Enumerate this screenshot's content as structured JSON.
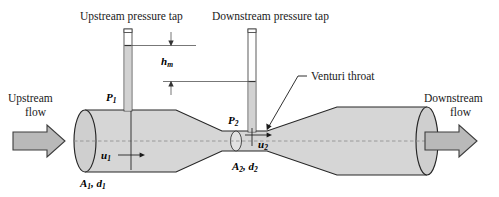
{
  "figure": {
    "background_color": "#ffffff"
  },
  "labels": {
    "upstream_tap": "Upstream pressure tap",
    "downstream_tap": "Downstream pressure tap",
    "venturi_throat": "Venturi throat",
    "upstream_flow_line1": "Upstream",
    "upstream_flow_line2": "flow",
    "downstream_flow_line1": "Downstream",
    "downstream_flow_line2": "flow"
  },
  "symbols": {
    "p1_base": "P",
    "p1_sub": "1",
    "p2_base": "P",
    "p2_sub": "2",
    "u1_base": "u",
    "u1_sub": "1",
    "u2_base": "u",
    "u2_sub": "2",
    "hm_base": "h",
    "hm_sub": "m",
    "area1_a": "A",
    "area1_a_sub": "1",
    "area1_sep": ", ",
    "area1_d": "d",
    "area1_d_sub": "1",
    "area2_a": "A",
    "area2_a_sub": "2",
    "area2_sep": ", ",
    "area2_d": "d",
    "area2_d_sub": "2"
  },
  "colors": {
    "pipe_fill": "#d6d6d6",
    "pipe_outline": "#262626",
    "endcap_fill": "#cfcfcf",
    "arrow_fill": "#b9b9b9",
    "arrow_outline": "#3d3d3d",
    "manometer_liquid": "#d2d2d2",
    "centerline": "#8a8a8a",
    "text": "#1a1a1a"
  },
  "geometry": {
    "width": 499,
    "height": 197,
    "pipe_axis_y": 141,
    "inlet_left_x": 85,
    "inlet_right_x": 176,
    "throat_left_x": 222,
    "throat_right_x": 267,
    "outlet_left_x": 337,
    "outlet_right_x": 427,
    "inlet_half_height": 31,
    "throat_half_height": 10
  }
}
